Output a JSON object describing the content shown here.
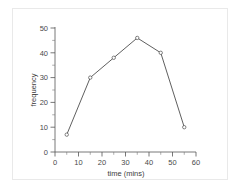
{
  "figure": {
    "background_color": "#ffffff",
    "frame_color": "#e9e9e9",
    "line_color": "#4d4d4d",
    "text_color": "#3c3c3c"
  },
  "chart_data": {
    "type": "line",
    "title": "",
    "xlabel": "time (mins)",
    "ylabel": "frequency",
    "x": [
      5,
      15,
      25,
      35,
      45,
      55
    ],
    "values": [
      7,
      30,
      38,
      46,
      40,
      10
    ],
    "series": [
      {
        "name": "frequency",
        "x": [
          5,
          15,
          25,
          35,
          45,
          55
        ],
        "values": [
          7,
          30,
          38,
          46,
          40,
          10
        ]
      }
    ],
    "xlim": [
      0,
      60
    ],
    "ylim": [
      0,
      50
    ],
    "xticks": [
      0,
      10,
      20,
      30,
      40,
      50,
      60
    ],
    "yticks": [
      0,
      10,
      20,
      30,
      40,
      50
    ],
    "xtick_labels": [
      "0",
      "10",
      "20",
      "30",
      "40",
      "50",
      "60"
    ],
    "ytick_labels": [
      "0",
      "10",
      "20",
      "30",
      "40",
      "50"
    ],
    "xminor_ticks": [
      5,
      15,
      25,
      35,
      45,
      55
    ],
    "yminor_ticks": [
      5,
      15,
      25,
      35,
      45
    ],
    "grid": false,
    "legend": false,
    "markers": "open-circle",
    "marker_color": "#ffffff",
    "marker_edge_color": "#4d4d4d"
  }
}
